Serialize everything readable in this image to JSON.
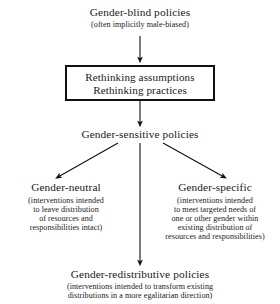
{
  "diagram": {
    "type": "flowchart",
    "nodes": {
      "top": {
        "title": "Gender-blind policies",
        "subtitle": "(often implicitly male-biased)"
      },
      "box": {
        "line1": "Rethinking assumptions",
        "line2": "Rethinking practices"
      },
      "sensitive": {
        "title": "Gender-sensitive policies"
      },
      "neutral": {
        "title": "Gender-neutral",
        "sub_lines": [
          "(interventions intended",
          "to leave distribution",
          "of resources and",
          "responsibilities intact)"
        ]
      },
      "specific": {
        "title": "Gender-specific",
        "sub_lines": [
          "(interventions intended",
          "to meet targeted needs of",
          "one or other gender within",
          "existing distribution of",
          "resources and responsibilities)"
        ]
      },
      "redistributive": {
        "title": "Gender-redistributive policies",
        "sub_lines": [
          "(interventions intended to transform existing",
          "distributions in a more egalitarian direction)"
        ]
      }
    },
    "colors": {
      "ink": "#1a1a1a",
      "stroke": "#111111",
      "background": "#ffffff"
    }
  }
}
